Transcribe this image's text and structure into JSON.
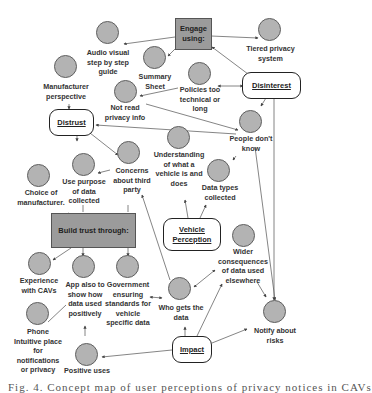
{
  "diagram": {
    "colors": {
      "circle_fill": "#b3b3b3",
      "circle_stroke": "#5f5f5f",
      "box_fill": "#9b9b9b",
      "line": "#555555"
    },
    "themes": {
      "distrust": "Distrust",
      "disinterest": "Disinterest",
      "vehicle_perception": "Vehicle\nPerception",
      "impact": "Impact"
    },
    "boxes": {
      "engage": "Engage\nusing:",
      "build_trust": "Build trust through:"
    },
    "nodes": {
      "audio_visual": "Audio visual\nstep by step\nguide",
      "summary_sheet": "Summary\nSheet",
      "tiered_privacy": "Tiered privacy\nsystem",
      "manufacturer_perspective": "Manufacturer\nperspective",
      "not_read": "Not read\nprivacy info",
      "policies": "Policies too\ntechnical or\nlong",
      "people_dont_know": "People don't\nknow",
      "use_purpose": "Use purpose\nof data\ncollected",
      "concerns_third_party": "Concerns\nabout third\nparty",
      "understanding_vehicle": "Understanding\nof what a\nvehicle is and\ndoes",
      "data_types": "Data types\ncollected",
      "choice_manufacturer": "Choice of\nmanufacturer.",
      "experience_cavs": "Experience\nwith CAVs",
      "app_also": "App also to\nshow how\ndata used\npositively",
      "government": "Government\nensuring\nstandards for\nvehicle\nspecific data",
      "who_gets_data": "Who gets the\ndata",
      "wider_consequences": "Wider\nconsequences\nof data used\nelsewhere",
      "phone": "Phone\nIntuitive place\nfor\nnotifications\nor privacy",
      "positive_uses": "Positive uses",
      "notify_risks": "Notify about\nrisks"
    },
    "caption": "Fig. 4.  Concept map  of  user perceptions of  privacy notices in CAVs"
  }
}
